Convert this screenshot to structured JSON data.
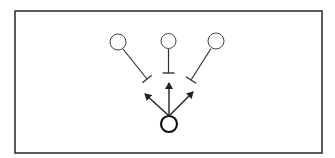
{
  "diagram": {
    "type": "signaling-network",
    "frame": {
      "x": 15,
      "y": 11,
      "width": 307,
      "height": 142,
      "stroke": "#333333"
    },
    "colors": {
      "stroke": "#333333",
      "background": "#ffffff"
    },
    "nodes": [
      {
        "id": "top-left",
        "cx": 118,
        "cy": 42,
        "r": 8,
        "stroke_width": 1
      },
      {
        "id": "top-center",
        "cx": 168.5,
        "cy": 41,
        "r": 7.5,
        "stroke_width": 1
      },
      {
        "id": "top-right",
        "cx": 216,
        "cy": 41,
        "r": 8,
        "stroke_width": 1
      },
      {
        "id": "bottom-center",
        "cx": 169,
        "cy": 124,
        "r": 8,
        "stroke_width": 2.2
      }
    ],
    "inhibitions": [
      {
        "from": "top-left",
        "x1": 123,
        "y1": 49,
        "x2": 147,
        "y2": 79
      },
      {
        "from": "top-center",
        "x1": 168.5,
        "y1": 48.5,
        "x2": 168.5,
        "y2": 73
      },
      {
        "from": "top-right",
        "x1": 211,
        "y1": 48.5,
        "x2": 191,
        "y2": 80
      }
    ],
    "activations": [
      {
        "from": "bottom-center",
        "x1": 168,
        "y1": 115,
        "x2": 145,
        "y2": 94
      },
      {
        "from": "bottom-center",
        "x1": 169,
        "y1": 115,
        "x2": 169,
        "y2": 83
      },
      {
        "from": "bottom-center",
        "x1": 170,
        "y1": 115,
        "x2": 193,
        "y2": 92
      }
    ]
  }
}
